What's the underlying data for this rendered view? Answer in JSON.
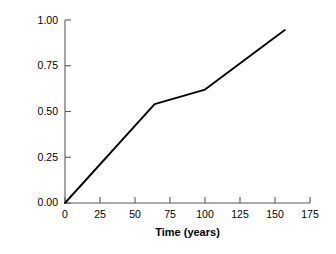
{
  "chart_data": {
    "type": "line",
    "title": "",
    "xlabel": "Time (years)",
    "ylabel": "Surface reduction",
    "xlim": [
      0,
      175
    ],
    "ylim": [
      0.0,
      1.0
    ],
    "grid": false,
    "legend": null,
    "line_color": "#000000",
    "background_color": "#ffffff",
    "xticks": [
      0,
      25,
      50,
      75,
      100,
      125,
      150,
      175
    ],
    "xtick_labels": [
      "0",
      "25",
      "50",
      "75",
      "100",
      "125",
      "150",
      "175"
    ],
    "yticks": [
      0.0,
      0.25,
      0.5,
      0.75,
      1.0
    ],
    "ytick_labels": [
      "0.00",
      "0.25",
      "0.50",
      "0.75",
      "1.00"
    ],
    "series": [
      {
        "name": "surface reduction",
        "x": [
          0,
          64,
          100,
          157
        ],
        "y": [
          0.0,
          0.54,
          0.62,
          0.945
        ]
      }
    ]
  },
  "axes": {
    "y_title": "Surface reduction",
    "x_title": "Time (years)",
    "y_labels": [
      "1.00",
      "0.75",
      "0.50",
      "0.25",
      "0.00"
    ],
    "x_labels": [
      "0",
      "25",
      "50",
      "75",
      "100",
      "125",
      "150",
      "175"
    ]
  }
}
